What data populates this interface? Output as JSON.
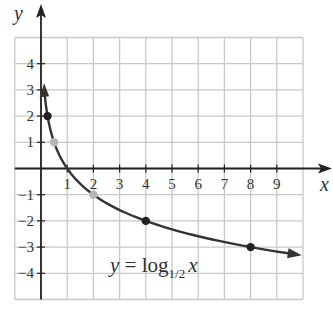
{
  "chart_data": {
    "type": "line",
    "title": "",
    "function": "y = log_{1/2} x",
    "xlabel": "x",
    "ylabel": "y",
    "xlim": [
      -1,
      10
    ],
    "ylim": [
      -5,
      5
    ],
    "grid": true,
    "x_ticks": [
      1,
      2,
      3,
      4,
      5,
      6,
      7,
      8,
      9
    ],
    "y_ticks": [
      4,
      3,
      2,
      1,
      -1,
      -2,
      -3,
      -4
    ],
    "x_tick_labels": [
      "1",
      "2",
      "3",
      "4",
      "5",
      "6",
      "7",
      "8",
      "9"
    ],
    "y_tick_labels": [
      "4",
      "3",
      "2",
      "1",
      "-1",
      "-2",
      "-3",
      "-4"
    ],
    "series": [
      {
        "name": "y = log_{1/2} x",
        "x": [
          0.125,
          0.25,
          0.5,
          1,
          2,
          4,
          8,
          10
        ],
        "y": [
          3,
          2,
          1,
          0,
          -1,
          -2,
          -3,
          -3.32
        ],
        "color": "#333333"
      }
    ],
    "points": [
      {
        "x": 0.25,
        "y": 2,
        "color": "#222222"
      },
      {
        "x": 0.5,
        "y": 1,
        "color": "#b5b5b5"
      },
      {
        "x": 2,
        "y": -1,
        "color": "#b5b5b5"
      },
      {
        "x": 4,
        "y": -2,
        "color": "#222222"
      },
      {
        "x": 8,
        "y": -3,
        "color": "#222222"
      }
    ],
    "annotations": [
      {
        "text": "y = log_{1/2} x",
        "x": 5.2,
        "y": -3.6
      }
    ]
  },
  "labels": {
    "x_axis": "x",
    "y_axis": "y",
    "eq_y": "y",
    "eq_equals": " = log",
    "eq_base": "1/2",
    "eq_x": "x"
  },
  "colors": {
    "grid": "#c8c8c8",
    "axis": "#222222",
    "curve": "#333333",
    "dark_point": "#222222",
    "light_point": "#b5b5b5"
  }
}
